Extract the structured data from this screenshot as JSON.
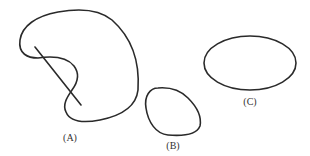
{
  "figure": {
    "shapes": [
      {
        "id": "A",
        "label": "(A)",
        "description": "non-convex kidney-shaped region with line segment crossing boundary"
      },
      {
        "id": "B",
        "label": "(B)",
        "description": "convex rounded region"
      },
      {
        "id": "C",
        "label": "(C)",
        "description": "ellipse (convex region)"
      }
    ],
    "stroke_color": "#2a2a2a",
    "background": "#ffffff"
  }
}
